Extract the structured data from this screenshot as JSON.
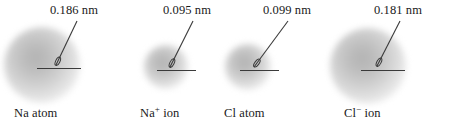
{
  "figure": {
    "background_color": "#ffffff",
    "line_color": "#3a3a3a",
    "cloud_core_color": "#b4b4b4",
    "width": 461,
    "height": 135
  },
  "chart_data": {
    "type": "diagram",
    "title": "",
    "subtitle": "",
    "xlabel": "",
    "ylabel": "",
    "unit": "nm",
    "categories": [
      "Na atom",
      "Na+ ion",
      "Cl atom",
      "Cl- ion"
    ],
    "values": [
      0.186,
      0.095,
      0.099,
      0.181
    ],
    "value_labels": [
      "0.186 nm",
      "0.095 nm",
      "0.099 nm",
      "0.181 nm"
    ],
    "legend": [],
    "grid": false
  },
  "species": [
    {
      "id": "na-atom",
      "measure_label": "0.186 nm",
      "name_main": "Na",
      "name_charge": "",
      "name_suffix": " atom",
      "cloud": {
        "cx": 42,
        "cy": 65,
        "d": 76
      },
      "radius_line": {
        "x1": 37,
        "x2": 81,
        "y": 68
      },
      "leader": {
        "x1": 56,
        "y1": 65,
        "x2": 77,
        "y2": 21
      },
      "measure_x": 50,
      "label_x": 14
    },
    {
      "id": "na-ion",
      "measure_label": "0.095 nm",
      "name_main": "Na",
      "name_charge": "+",
      "name_suffix": " ion",
      "cloud": {
        "cx": 166,
        "cy": 67,
        "d": 44
      },
      "radius_line": {
        "x1": 157,
        "x2": 196,
        "y": 70
      },
      "leader": {
        "x1": 170,
        "y1": 67,
        "x2": 193,
        "y2": 21
      },
      "measure_x": 163,
      "label_x": 140
    },
    {
      "id": "cl-atom",
      "measure_label": "0.099 nm",
      "name_main": "Cl",
      "name_charge": "",
      "name_suffix": " atom",
      "cloud": {
        "cx": 248,
        "cy": 67,
        "d": 46
      },
      "radius_line": {
        "x1": 240,
        "x2": 279,
        "y": 70
      },
      "leader": {
        "x1": 254,
        "y1": 67,
        "x2": 288,
        "y2": 21
      },
      "measure_x": 263,
      "label_x": 224
    },
    {
      "id": "cl-ion",
      "measure_label": "0.181 nm",
      "name_main": "Cl",
      "name_charge": "−",
      "name_suffix": " ion",
      "cloud": {
        "cx": 368,
        "cy": 66,
        "d": 76
      },
      "radius_line": {
        "x1": 361,
        "x2": 405,
        "y": 70
      },
      "leader": {
        "x1": 377,
        "y1": 66,
        "x2": 400,
        "y2": 21
      },
      "measure_x": 374,
      "label_x": 344
    }
  ]
}
